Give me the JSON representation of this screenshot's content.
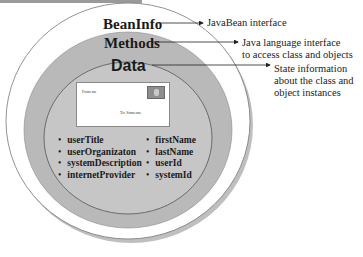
{
  "layers": {
    "outer": {
      "label": "BeanInfo",
      "description": "JavaBean interface",
      "color": "#ffffff"
    },
    "middle": {
      "label": "Methods",
      "description_lines": [
        "Java language interface",
        "to access class and objects"
      ],
      "color": "#b9b9b9"
    },
    "inner": {
      "label": "Data",
      "description_lines": [
        "State information",
        "about the class and",
        "object instances"
      ],
      "color": "#c6c6c6"
    }
  },
  "card": {
    "from_text": "From me",
    "to_text": "To: Someone",
    "avatar_icon": "person-photo-icon"
  },
  "fields": {
    "left": [
      "userTitle",
      "userOrganizaton",
      "systemDescription",
      "internetProvider"
    ],
    "right": [
      "firstName",
      "lastName",
      "userId",
      "systemId"
    ]
  }
}
